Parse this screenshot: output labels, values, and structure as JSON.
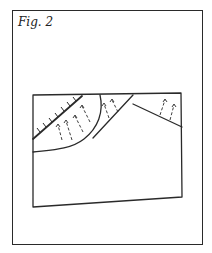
{
  "figure": {
    "caption": "Fig. 2",
    "colors": {
      "ink": "#2a2a2a",
      "background": "#ffffff"
    }
  }
}
